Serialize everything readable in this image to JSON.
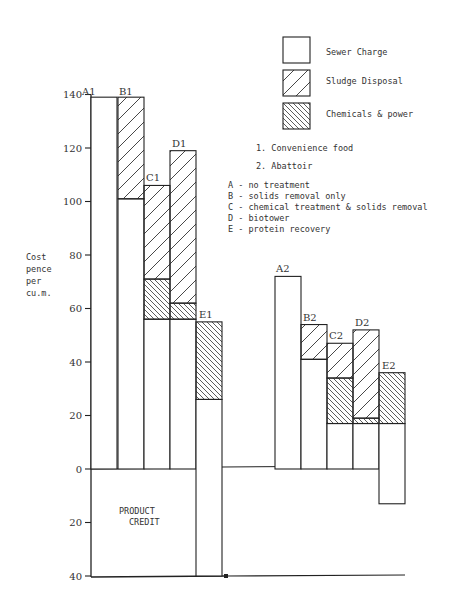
{
  "chart_data": {
    "type": "bar",
    "subtype": "stacked",
    "title": "",
    "ylabel": "Cost pence per cu.m.",
    "ylabel_lines": [
      "Cost",
      "pence",
      "per",
      "cu.m."
    ],
    "xlabel": "",
    "ylim": [
      -40,
      140
    ],
    "yticks": [
      140,
      120,
      100,
      80,
      60,
      40,
      20,
      0,
      -20,
      -40
    ],
    "ytick_labels": [
      "140",
      "120",
      "100",
      "80",
      "60",
      "40",
      "20",
      "0",
      "20",
      "40"
    ],
    "grid": false,
    "legend_position": "top-right",
    "legend": [
      {
        "name": "Sewer Charge",
        "pattern": "none"
      },
      {
        "name": "Sludge Disposal",
        "pattern": "forward-hatch"
      },
      {
        "name": "Chemicals & power",
        "pattern": "back-hatch"
      }
    ],
    "groups": [
      {
        "id": "1",
        "name": "Convenience food"
      },
      {
        "id": "2",
        "name": "Abattoir"
      }
    ],
    "treatments": [
      {
        "code": "A",
        "name": "no treatment"
      },
      {
        "code": "B",
        "name": "solids removal only"
      },
      {
        "code": "C",
        "name": "chemical treatment & solids removal"
      },
      {
        "code": "D",
        "name": "biotower"
      },
      {
        "code": "E",
        "name": "protein recovery"
      }
    ],
    "categories": [
      "A1",
      "B1",
      "C1",
      "D1",
      "E1",
      "A2",
      "B2",
      "C2",
      "D2",
      "E2"
    ],
    "bars": [
      {
        "label": "A1",
        "segments": [
          {
            "series": "Sewer Charge",
            "from": 0,
            "to": 139
          }
        ]
      },
      {
        "label": "B1",
        "segments": [
          {
            "series": "Sewer Charge",
            "from": 0,
            "to": 101
          },
          {
            "series": "Sludge Disposal",
            "from": 101,
            "to": 139
          }
        ]
      },
      {
        "label": "C1",
        "segments": [
          {
            "series": "Sewer Charge",
            "from": 0,
            "to": 56
          },
          {
            "series": "Chemicals & power",
            "from": 56,
            "to": 71
          },
          {
            "series": "Sludge Disposal",
            "from": 71,
            "to": 106
          }
        ]
      },
      {
        "label": "D1",
        "segments": [
          {
            "series": "Sewer Charge",
            "from": 0,
            "to": 56
          },
          {
            "series": "Chemicals & power",
            "from": 56,
            "to": 62
          },
          {
            "series": "Sludge Disposal",
            "from": 62,
            "to": 119
          }
        ]
      },
      {
        "label": "E1",
        "segments": [
          {
            "series": "Sewer Charge",
            "from": -40,
            "to": 26
          },
          {
            "series": "Chemicals & power",
            "from": 26,
            "to": 55
          }
        ]
      },
      {
        "label": "A2",
        "segments": [
          {
            "series": "Sewer Charge",
            "from": 0,
            "to": 72
          }
        ]
      },
      {
        "label": "B2",
        "segments": [
          {
            "series": "Sewer Charge",
            "from": 0,
            "to": 41
          },
          {
            "series": "Sludge Disposal",
            "from": 41,
            "to": 54
          }
        ]
      },
      {
        "label": "C2",
        "segments": [
          {
            "series": "Sewer Charge",
            "from": 0,
            "to": 17
          },
          {
            "series": "Chemicals & power",
            "from": 17,
            "to": 34
          },
          {
            "series": "Sludge Disposal",
            "from": 34,
            "to": 47
          }
        ]
      },
      {
        "label": "D2",
        "segments": [
          {
            "series": "Sewer Charge",
            "from": 0,
            "to": 17
          },
          {
            "series": "Chemicals & power",
            "from": 17,
            "to": 19
          },
          {
            "series": "Sludge Disposal",
            "from": 19,
            "to": 52
          }
        ]
      },
      {
        "label": "E2",
        "segments": [
          {
            "series": "Sewer Charge",
            "from": -13,
            "to": 17
          },
          {
            "series": "Chemicals & power",
            "from": 17,
            "to": 36
          }
        ]
      }
    ],
    "series": [
      {
        "name": "Sewer Charge",
        "values": [
          139,
          101,
          56,
          56,
          26,
          72,
          41,
          17,
          17,
          17
        ]
      },
      {
        "name": "Sludge Disposal",
        "values": [
          0,
          38,
          35,
          57,
          0,
          0,
          13,
          13,
          33,
          0
        ]
      },
      {
        "name": "Chemicals & power",
        "values": [
          0,
          0,
          15,
          6,
          29,
          0,
          0,
          17,
          2,
          19
        ]
      },
      {
        "name": "Product credit (below zero)",
        "values": [
          0,
          0,
          0,
          0,
          -40,
          0,
          0,
          0,
          0,
          -13
        ]
      }
    ],
    "totals": [
      139,
      139,
      106,
      119,
      55,
      72,
      54,
      47,
      52,
      36
    ],
    "annotations": [
      {
        "text": "PRODUCT CREDIT",
        "lines": [
          "PRODUCT",
          "CREDIT"
        ],
        "region": "below zero, group 1"
      }
    ]
  },
  "legend": {
    "items": [
      {
        "label": "Sewer Charge"
      },
      {
        "label": "Sludge Disposal"
      },
      {
        "label": "Chemicals & power"
      }
    ]
  },
  "notes": {
    "groups": [
      "1.  Convenience food",
      "2.  Abattoir"
    ],
    "treatments": [
      "A - no treatment",
      "B - solids removal only",
      "C - chemical treatment & solids removal",
      "D - biotower",
      "E - protein recovery"
    ]
  },
  "axis": {
    "ylabel_lines": [
      "Cost",
      "pence",
      "per",
      "cu.m."
    ],
    "tick_labels": [
      "140",
      "120",
      "100",
      "80",
      "60",
      "40",
      "20",
      "0",
      "20",
      "40"
    ]
  },
  "annotation": {
    "line1": "PRODUCT",
    "line2": "CREDIT"
  },
  "bar_labels": [
    "A1",
    "B1",
    "C1",
    "D1",
    "E1",
    "A2",
    "B2",
    "C2",
    "D2",
    "E2"
  ]
}
